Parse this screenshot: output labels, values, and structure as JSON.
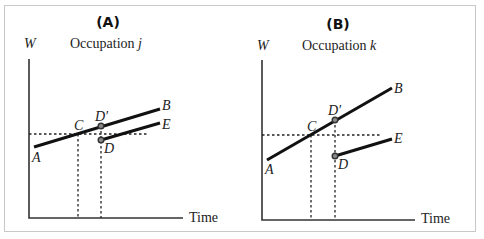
{
  "panels": [
    {
      "id": "A",
      "label": "(A)",
      "y_axis_label": "W",
      "subtitle_text": "Occupation ",
      "subtitle_var": "j",
      "x_axis_label": "Time",
      "point_labels": {
        "A": "A",
        "B": "B",
        "C": "C",
        "D": "D",
        "D_prime": "D′",
        "E": "E"
      }
    },
    {
      "id": "B",
      "label": "(B)",
      "y_axis_label": "W",
      "subtitle_text": "Occupation ",
      "subtitle_var": "k",
      "x_axis_label": "Time",
      "point_labels": {
        "A": "A",
        "B": "B",
        "C": "C",
        "D": "D",
        "D_prime": "D′",
        "E": "E"
      }
    }
  ],
  "colors": {
    "line": "#111111",
    "axis": "#333333",
    "point_fill": "#8a8a8a",
    "frame": "#c8c8c8"
  }
}
